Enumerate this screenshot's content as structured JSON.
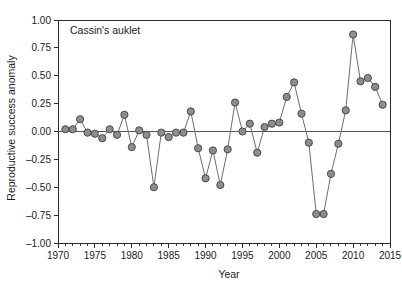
{
  "chart_data": {
    "type": "line",
    "title": "Cassin's auklet",
    "xlabel": "Year",
    "ylabel": "Reproductive success anomaly",
    "xlim": [
      1970,
      2015
    ],
    "ylim": [
      -1.0,
      1.0
    ],
    "grid": false,
    "legend": "none",
    "marker": "filled-circle-gray",
    "xticks": [
      1970,
      1975,
      1980,
      1985,
      1990,
      1995,
      2000,
      2005,
      2010,
      2015
    ],
    "xtick_labels": [
      "1970",
      "1975",
      "1980",
      "1985",
      "1990",
      "1995",
      "2000",
      "2005",
      "2010",
      "2015"
    ],
    "xminor_step": 1,
    "yticks": [
      -1.0,
      -0.75,
      -0.5,
      -0.25,
      0.0,
      0.25,
      0.5,
      0.75,
      1.0
    ],
    "ytick_labels": [
      "-1.00",
      "-0.75",
      "-0.50",
      "-0.25",
      "0.00",
      "0.25",
      "0.50",
      "0.75",
      "1.00"
    ],
    "zero_reference_line": 0.0,
    "series": [
      {
        "name": "Cassin's auklet reproductive success anomaly",
        "x": [
          1971,
          1972,
          1973,
          1974,
          1975,
          1976,
          1977,
          1978,
          1979,
          1980,
          1981,
          1982,
          1983,
          1984,
          1985,
          1986,
          1987,
          1988,
          1989,
          1990,
          1991,
          1992,
          1993,
          1994,
          1995,
          1996,
          1997,
          1998,
          1999,
          2000,
          2001,
          2002,
          2003,
          2004,
          2005,
          2006,
          2007,
          2008,
          2009,
          2010,
          2011,
          2012,
          2013,
          2014
        ],
        "values": [
          0.02,
          0.02,
          0.11,
          -0.01,
          -0.02,
          -0.06,
          0.02,
          -0.03,
          0.15,
          -0.14,
          0.01,
          -0.03,
          -0.5,
          -0.01,
          -0.05,
          -0.01,
          -0.01,
          0.18,
          -0.15,
          -0.42,
          -0.17,
          -0.48,
          -0.16,
          0.26,
          0.0,
          0.07,
          -0.19,
          0.04,
          0.07,
          0.08,
          0.31,
          0.44,
          0.16,
          -0.1,
          -0.74,
          -0.74,
          -0.38,
          -0.11,
          0.19,
          0.87,
          0.45,
          0.48,
          0.4,
          0.24
        ]
      }
    ]
  },
  "colors": {
    "marker_fill": "#8d8d8d",
    "marker_stroke": "#4a4a4a",
    "line": "#6e6e6e",
    "axis": "#2b2b2b",
    "zero_line": "#555555",
    "text": "#1a1a1a",
    "background": "#ffffff"
  }
}
